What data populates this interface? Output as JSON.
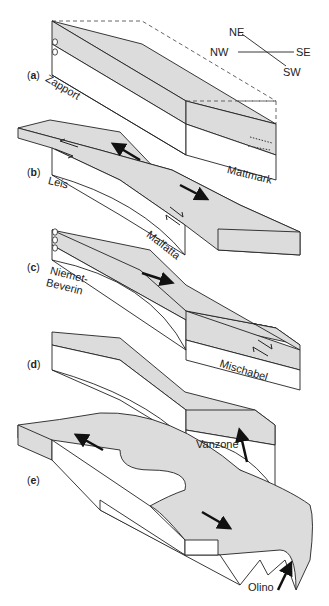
{
  "figure": {
    "header_fragment": "",
    "fill_color": "#dcdcdc",
    "stroke_color": "#222222",
    "compass": {
      "labels": [
        "NE",
        "NW",
        "SE",
        "SW"
      ]
    },
    "panels": [
      {
        "id": "a",
        "label_open": "(",
        "label_letter": "a",
        "label_close": ")",
        "units": [
          "Zapport",
          "Mattmark"
        ]
      },
      {
        "id": "b",
        "label_open": "(",
        "label_letter": "b",
        "label_close": ")",
        "units": [
          "Leis",
          "Malfatta"
        ]
      },
      {
        "id": "c",
        "label_open": "(",
        "label_letter": "c",
        "label_close": ")",
        "units": [
          "Niemet-",
          "Beverin",
          "Mischabel"
        ]
      },
      {
        "id": "d",
        "label_open": "(",
        "label_letter": "d",
        "label_close": ")",
        "units": [
          "Vanzone"
        ]
      },
      {
        "id": "e",
        "label_open": "(",
        "label_letter": "e",
        "label_close": ")",
        "units": [
          "Olino"
        ]
      }
    ]
  }
}
